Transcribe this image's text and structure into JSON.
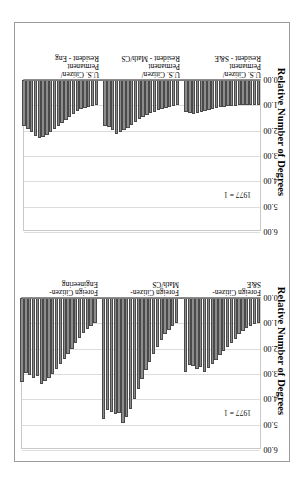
{
  "page": {
    "background_color": "#ffffff",
    "frame_color": "#9a9a9a",
    "orientation": "landscape-rotated-90"
  },
  "style": {
    "bar_fill": "#8c8c8c",
    "bar_stroke": "#4a4a4a",
    "grid_color": "#dcdcdc",
    "axis_color": "#7b7b7b"
  },
  "charts": [
    {
      "id": "chart-us-citizen-permanent-resident",
      "title": "Relative Number of Degrees",
      "note": "1977 = 1",
      "axis": {
        "ticks": [
          "0.00",
          "1.00",
          "2.00",
          "3.00",
          "4.00",
          "5.00",
          "6.00"
        ],
        "min": 0,
        "max": 6,
        "step": 1
      },
      "groups": [
        {
          "label": "U.S. Citizen/\nPermanent\nResident - S&E"
        },
        {
          "label": "U.S. Citizen/\nPermanent\nResident - Math/CS"
        },
        {
          "label": "U.S. Citizen/\nPermanent\nResident - Eng"
        }
      ]
    },
    {
      "id": "chart-foreign-citizen",
      "title": "Relative Number of Degrees",
      "note": "1977 = 1",
      "axis": {
        "ticks": [
          "0.00",
          "1.00",
          "2.00",
          "3.00",
          "4.00",
          "5.00",
          "6.00"
        ],
        "min": 0,
        "max": 6,
        "step": 1
      },
      "groups": [
        {
          "label": "Foreign Citizen-\nS&E"
        },
        {
          "label": "Foreign Citizen-\nMath/CS"
        },
        {
          "label": "Foreign Citizen-\nEngineering"
        }
      ]
    }
  ],
  "chart_data": [
    {
      "type": "bar",
      "orientation": "horizontal",
      "title": "Relative Number of Degrees",
      "xlabel": "Relative Number of Degrees",
      "ylabel": "",
      "xlim": [
        0,
        6
      ],
      "grid": true,
      "annotation": "1977 = 1",
      "legend": "none",
      "categories": [
        "U.S. Citizen/Permanent Resident - S&E",
        "U.S. Citizen/Permanent Resident - Math/CS",
        "U.S. Citizen/Permanent Resident - Eng"
      ],
      "series": [
        {
          "name": "U.S. Citizen/Permanent Resident - S&E",
          "values": [
            1.0,
            0.99,
            0.97,
            0.97,
            0.98,
            0.99,
            1.01,
            1.02,
            1.03,
            1.05,
            1.07,
            1.1,
            1.14,
            1.18,
            1.22,
            1.26,
            1.3,
            1.33,
            1.31,
            1.27
          ]
        },
        {
          "name": "U.S. Citizen/Permanent Resident - Math/CS",
          "values": [
            1.0,
            1.04,
            1.06,
            1.1,
            1.16,
            1.2,
            1.26,
            1.32,
            1.38,
            1.46,
            1.55,
            1.66,
            1.78,
            1.88,
            1.96,
            2.05,
            2.12,
            1.98,
            1.86,
            1.8
          ]
        },
        {
          "name": "U.S. Citizen/Permanent Resident - Eng",
          "values": [
            1.0,
            1.02,
            1.05,
            1.1,
            1.16,
            1.24,
            1.34,
            1.46,
            1.58,
            1.7,
            1.82,
            1.94,
            2.06,
            2.16,
            2.24,
            2.3,
            2.2,
            2.06,
            1.92,
            1.82
          ]
        }
      ]
    },
    {
      "type": "bar",
      "orientation": "horizontal",
      "title": "Relative Number of Degrees",
      "xlabel": "Relative Number of Degrees",
      "ylabel": "",
      "xlim": [
        0,
        6
      ],
      "grid": true,
      "annotation": "1977 = 1",
      "legend": "none",
      "categories": [
        "Foreign Citizen- S&E",
        "Foreign Citizen- Math/CS",
        "Foreign Citizen- Engineering"
      ],
      "series": [
        {
          "name": "Foreign Citizen- S&E",
          "values": [
            1.0,
            1.04,
            1.1,
            1.18,
            1.3,
            1.44,
            1.6,
            1.76,
            1.92,
            2.08,
            2.26,
            2.44,
            2.62,
            2.78,
            2.92,
            2.74,
            2.8,
            2.7,
            2.66,
            2.92
          ]
        },
        {
          "name": "Foreign Citizen- Math/CS",
          "values": [
            1.0,
            1.12,
            1.26,
            1.44,
            1.66,
            1.92,
            2.22,
            2.54,
            2.86,
            3.2,
            3.58,
            3.98,
            4.38,
            4.7,
            4.92,
            4.52,
            4.58,
            4.5,
            4.44,
            4.78
          ]
        },
        {
          "name": "Foreign Citizen- Engineering",
          "values": [
            1.0,
            1.1,
            1.22,
            1.38,
            1.56,
            1.78,
            2.0,
            2.22,
            2.42,
            2.62,
            2.82,
            3.0,
            3.14,
            3.26,
            3.38,
            3.08,
            3.14,
            3.02,
            2.96,
            3.3
          ]
        }
      ]
    }
  ]
}
